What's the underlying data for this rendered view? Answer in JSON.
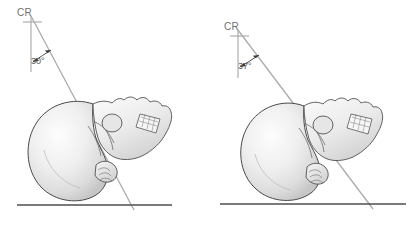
{
  "figure": {
    "background_color": "#ffffff",
    "ray_line_color": "#a8a8a8",
    "baseline_color": "#5a5a5a",
    "outline_color": "#444444",
    "bone_fill_light": "#f7f7f7",
    "bone_fill_mid": "#e2e2e2",
    "bone_fill_dark": "#c3c3c3",
    "label_color": "#6f6f6f"
  },
  "panels": [
    {
      "id": "left",
      "cr_label": "CR",
      "angle_label": "30°",
      "angle_degrees": 30,
      "subject": "lateral skull"
    },
    {
      "id": "right",
      "cr_label": "CR",
      "angle_label": "37°",
      "angle_degrees": 37,
      "subject": "lateral skull"
    }
  ]
}
